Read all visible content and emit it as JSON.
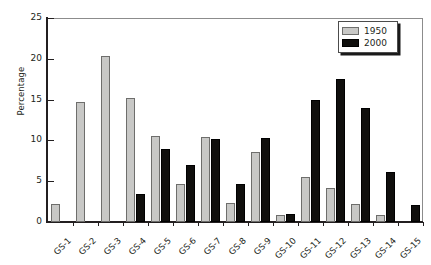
{
  "chart_data": {
    "type": "bar",
    "title": "",
    "subtitle": "",
    "xlabel": "",
    "ylabel": "Percentage",
    "ylim": [
      0,
      25
    ],
    "yticks": [
      0,
      5,
      10,
      15,
      20,
      25
    ],
    "ytick_labels": [
      "0",
      "5",
      "10",
      "15",
      "20",
      "25"
    ],
    "grid": false,
    "legend_position": "top-right",
    "categories": [
      "GS-1",
      "GS-2",
      "GS-3",
      "GS-4",
      "GS-5",
      "GS-6",
      "GS-7",
      "GS-8",
      "GS-9",
      "GS-10",
      "GS-11",
      "GS-12",
      "GS-13",
      "GS-14",
      "GS-15"
    ],
    "series": [
      {
        "name": "1950",
        "color": "#c8c8c6",
        "values": [
          2.2,
          14.7,
          20.3,
          15.2,
          10.6,
          4.7,
          10.4,
          2.3,
          8.6,
          0.9,
          5.5,
          4.2,
          2.2,
          0.9,
          0.0
        ]
      },
      {
        "name": "2000",
        "color": "#100f0d",
        "values": [
          0.0,
          0.0,
          0.0,
          3.4,
          9.0,
          7.0,
          10.2,
          4.6,
          10.3,
          1.0,
          15.0,
          17.5,
          14.0,
          6.1,
          2.1
        ]
      }
    ],
    "annotations": []
  },
  "legend": {
    "entries": [
      {
        "label": "1950",
        "swatch": "legend-swatch-1950"
      },
      {
        "label": "2000",
        "swatch": "legend-swatch-2000"
      }
    ]
  },
  "axes": {
    "y_title": "Percentage"
  }
}
